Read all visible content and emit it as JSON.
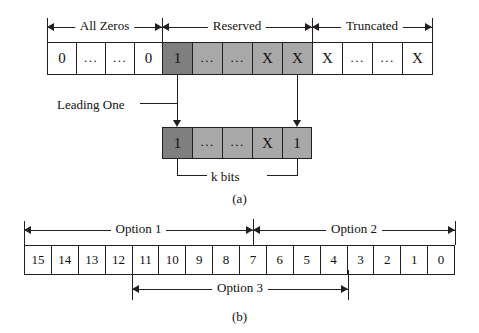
{
  "figure": {
    "part_a": {
      "caption": "(a)",
      "spans": [
        {
          "label": "All Zeros"
        },
        {
          "label": "Reserved"
        },
        {
          "label": "Truncated"
        }
      ],
      "bit_cells": [
        {
          "value": "0",
          "shade": "plain"
        },
        {
          "value": "...",
          "shade": "plain"
        },
        {
          "value": "...",
          "shade": "plain"
        },
        {
          "value": "0",
          "shade": "plain"
        },
        {
          "value": "1",
          "shade": "dark"
        },
        {
          "value": "...",
          "shade": "mid"
        },
        {
          "value": "...",
          "shade": "mid"
        },
        {
          "value": "X",
          "shade": "mid"
        },
        {
          "value": "X",
          "shade": "mid"
        },
        {
          "value": "X",
          "shade": "plain"
        },
        {
          "value": "...",
          "shade": "plain"
        },
        {
          "value": "...",
          "shade": "plain"
        },
        {
          "value": "X",
          "shade": "plain"
        }
      ],
      "leading_one_label": "Leading One",
      "k_cells": [
        {
          "value": "1",
          "shade": "dark"
        },
        {
          "value": "...",
          "shade": "mid"
        },
        {
          "value": "...",
          "shade": "mid"
        },
        {
          "value": "X",
          "shade": "mid"
        },
        {
          "value": "1",
          "shade": "mid"
        }
      ],
      "k_bits_label": "k bits"
    },
    "part_b": {
      "caption": "(b)",
      "option1_label": "Option 1",
      "option2_label": "Option 2",
      "option3_label": "Option 3",
      "bit_numbers": [
        "15",
        "14",
        "13",
        "12",
        "11",
        "10",
        "9",
        "8",
        "7",
        "6",
        "5",
        "4",
        "3",
        "2",
        "1",
        "0"
      ]
    }
  },
  "colors": {
    "stroke": "#231f20",
    "dark_shade": "#7f7f7f",
    "mid_shade": "#a8a8a8",
    "background": "#ffffff"
  }
}
